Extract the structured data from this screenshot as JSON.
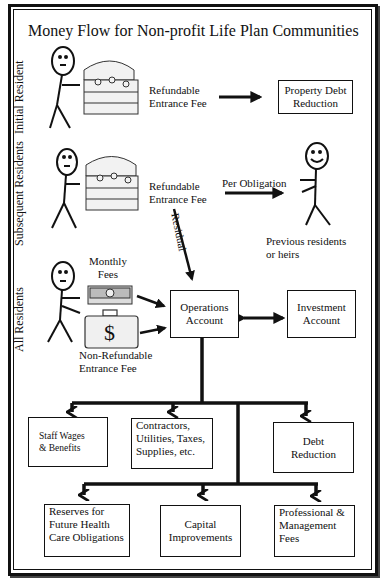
{
  "title": "Money Flow for Non-profit Life Plan Communities",
  "rows": {
    "initial": {
      "label": "Initial Resident",
      "fee_line1": "Refundable",
      "fee_line2": "Entrance Fee",
      "target": "Property Debt Reduction",
      "target_line1": "Property Debt",
      "target_line2": "Reduction"
    },
    "subsequent": {
      "label": "Subsequent Residents",
      "fee_line1": "Refundable",
      "fee_line2": "Entrance Fee",
      "arrow_label": "Per Obligation",
      "residual_label": "Residual",
      "recipient_line1": "Previous residents",
      "recipient_line2": "or heirs"
    },
    "all": {
      "label": "All Residents",
      "monthly_line1": "Monthly",
      "monthly_line2": "Fees",
      "nonref_line1": "Non-Refundable",
      "nonref_line2": "Entrance Fee"
    }
  },
  "accounts": {
    "operations_line1": "Operations",
    "operations_line2": "Account",
    "investment_line1": "Investment",
    "investment_line2": "Account"
  },
  "outputs_row1": [
    {
      "line1": "Staff Wages",
      "line2": "& Benefits"
    },
    {
      "line1": "Contractors,",
      "line2": "Utilities, Taxes,",
      "line3": "Supplies, etc."
    },
    {
      "line1": "Debt",
      "line2": "Reduction"
    }
  ],
  "outputs_row2": [
    {
      "line1": "Reserves for",
      "line2": "Future Health",
      "line3": "Care Obligations"
    },
    {
      "line1": "Capital",
      "line2": "Improvements"
    },
    {
      "line1": "Professional &",
      "line2": "Management",
      "line3": "Fees"
    }
  ],
  "icons": {
    "dollar": "$"
  }
}
